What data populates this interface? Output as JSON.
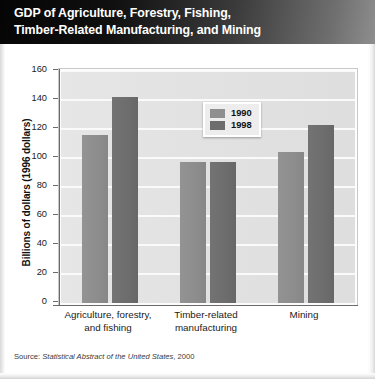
{
  "header": {
    "title": "GDP of Agriculture, Forestry, Fishing,\nTimber-Related Manufacturing, and Mining"
  },
  "source": {
    "prefix": "Source:",
    "publication": "Statistical Abstract of the United States",
    "year": ", 2000"
  },
  "colors": {
    "series_1990": "#8f8f8f",
    "series_1998": "#6d6d6d",
    "plot_background": "#e2e2e2",
    "gridline": "#fafafa",
    "axis": "#6a6a6a",
    "header_background": "#101010",
    "header_text": "#ffffff"
  },
  "chart_data": {
    "type": "bar",
    "title": "GDP of Agriculture, Forestry, Fishing, Timber-Related Manufacturing, and Mining",
    "xlabel": "",
    "ylabel": "Billions of dollars (1996 dollars)",
    "ylim": [
      0,
      160
    ],
    "yticks": [
      0,
      20,
      40,
      60,
      80,
      100,
      120,
      140,
      160
    ],
    "ytick_labels": [
      "0",
      "20",
      "40",
      "60",
      "80",
      "100",
      "120",
      "140",
      "160"
    ],
    "grid": true,
    "legend_position": "upper center",
    "categories": [
      "Agriculture, forestry,\nand fishing",
      "Timber-related\nmanufacturing",
      "Mining"
    ],
    "series": [
      {
        "name": "1990",
        "values": [
          116,
          97,
          104
        ]
      },
      {
        "name": "1998",
        "values": [
          142,
          97,
          123
        ]
      }
    ]
  }
}
